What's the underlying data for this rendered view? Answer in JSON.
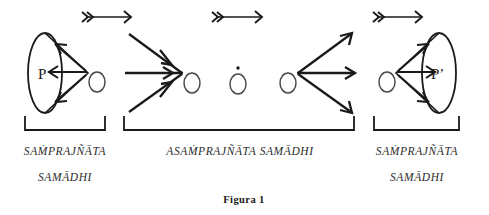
{
  "figure": {
    "caption": "Figura  1",
    "cone_left_label": "P",
    "cone_right_label": "P’",
    "stage_labels": {
      "left_line1": "SAṀPRAJÑĀTA",
      "left_line2": "SAMĀDHI",
      "middle": "ASAṀPRAJÑĀTA SAMĀDHI",
      "right_line1": "SAṀPRAJÑĀTA",
      "right_line2": "SAMĀDHI"
    },
    "colors": {
      "ink": "#1a1a1a",
      "ink_light": "#4a4a4a",
      "background": "#ffffff"
    }
  }
}
